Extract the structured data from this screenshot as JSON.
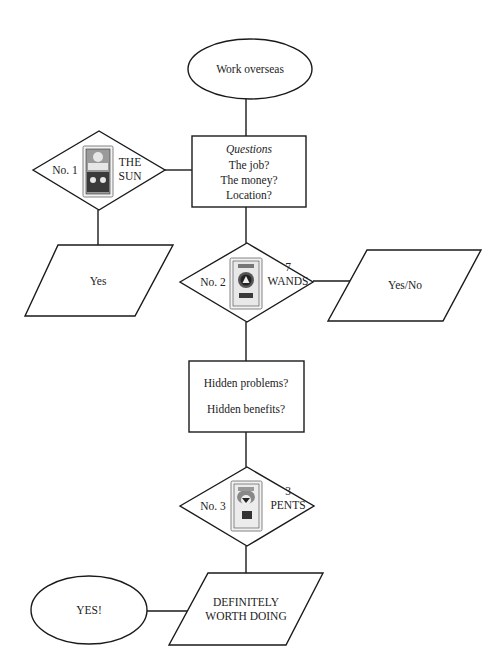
{
  "diagram": {
    "type": "flowchart",
    "nodes": {
      "start": {
        "shape": "ellipse",
        "label": "Work overseas"
      },
      "questions": {
        "shape": "rectangle",
        "heading": "Questions",
        "lines": [
          "The job?",
          "The money?",
          "Location?"
        ]
      },
      "card1": {
        "shape": "diamond",
        "number": "No. 1",
        "card_line1": "THE",
        "card_line2": "SUN",
        "card_icon": "tarot-card-the-sun"
      },
      "answer1": {
        "shape": "parallelogram",
        "label": "Yes"
      },
      "card2": {
        "shape": "diamond",
        "number": "No. 2",
        "card_line1": "7",
        "card_line2": "WANDS",
        "card_icon": "tarot-card-seven-of-wands"
      },
      "answer2": {
        "shape": "parallelogram",
        "label": "Yes/No"
      },
      "hidden": {
        "shape": "rectangle",
        "lines": [
          "Hidden problems?",
          "Hidden benefits?"
        ]
      },
      "card3": {
        "shape": "diamond",
        "number": "No. 3",
        "card_line1": "3",
        "card_line2": "PENTS",
        "card_icon": "tarot-card-three-of-pentacles"
      },
      "conclusion": {
        "shape": "parallelogram",
        "lines": [
          "DEFINITELY",
          "WORTH DOING"
        ]
      },
      "end": {
        "shape": "ellipse",
        "label": "YES!"
      }
    },
    "edges": [
      [
        "start",
        "questions"
      ],
      [
        "card1",
        "questions"
      ],
      [
        "card1",
        "answer1"
      ],
      [
        "questions",
        "card2"
      ],
      [
        "card2",
        "answer2"
      ],
      [
        "card2",
        "hidden"
      ],
      [
        "hidden",
        "card3"
      ],
      [
        "card3",
        "conclusion"
      ],
      [
        "conclusion",
        "end"
      ]
    ],
    "colors": {
      "stroke": "#1a1a1a",
      "background": "#ffffff",
      "text": "#222222"
    }
  }
}
